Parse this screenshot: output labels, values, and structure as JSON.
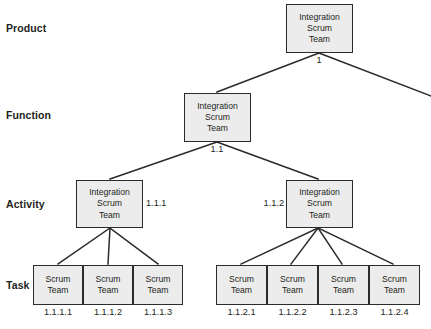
{
  "diagram": {
    "colors": {
      "node_fill": "#ececec",
      "node_border": "#2b2b2b",
      "edge": "#2b2b2b",
      "text": "#231f20",
      "background": "#ffffff"
    },
    "row_labels": [
      {
        "id": "product",
        "label": "Product"
      },
      {
        "id": "function",
        "label": "Function"
      },
      {
        "id": "activity",
        "label": "Activity"
      },
      {
        "id": "task",
        "label": "Task"
      }
    ],
    "nodes": {
      "product": {
        "line1": "Integration",
        "line2": "Scrum",
        "line3": "Team",
        "wbs": "1"
      },
      "function": {
        "line1": "Integration",
        "line2": "Scrum",
        "line3": "Team",
        "wbs": "1.1"
      },
      "activity_left": {
        "line1": "Integration",
        "line2": "Scrum",
        "line3": "Team",
        "wbs": "1.1.1"
      },
      "activity_right": {
        "line1": "Integration",
        "line2": "Scrum",
        "line3": "Team",
        "wbs": "1.1.2"
      }
    },
    "tasks_left": [
      {
        "line1": "Scrum",
        "line2": "Team",
        "wbs": "1.1.1.1"
      },
      {
        "line1": "Scrum",
        "line2": "Team",
        "wbs": "1.1.1.2"
      },
      {
        "line1": "Scrum",
        "line2": "Team",
        "wbs": "1.1.1.3"
      }
    ],
    "tasks_right": [
      {
        "line1": "Scrum",
        "line2": "Team",
        "wbs": "1.1.2.1"
      },
      {
        "line1": "Scrum",
        "line2": "Team",
        "wbs": "1.1.2.2"
      },
      {
        "line1": "Scrum",
        "line2": "Team",
        "wbs": "1.1.2.3"
      },
      {
        "line1": "Scrum",
        "line2": "Team",
        "wbs": "1.1.2.4"
      }
    ]
  }
}
